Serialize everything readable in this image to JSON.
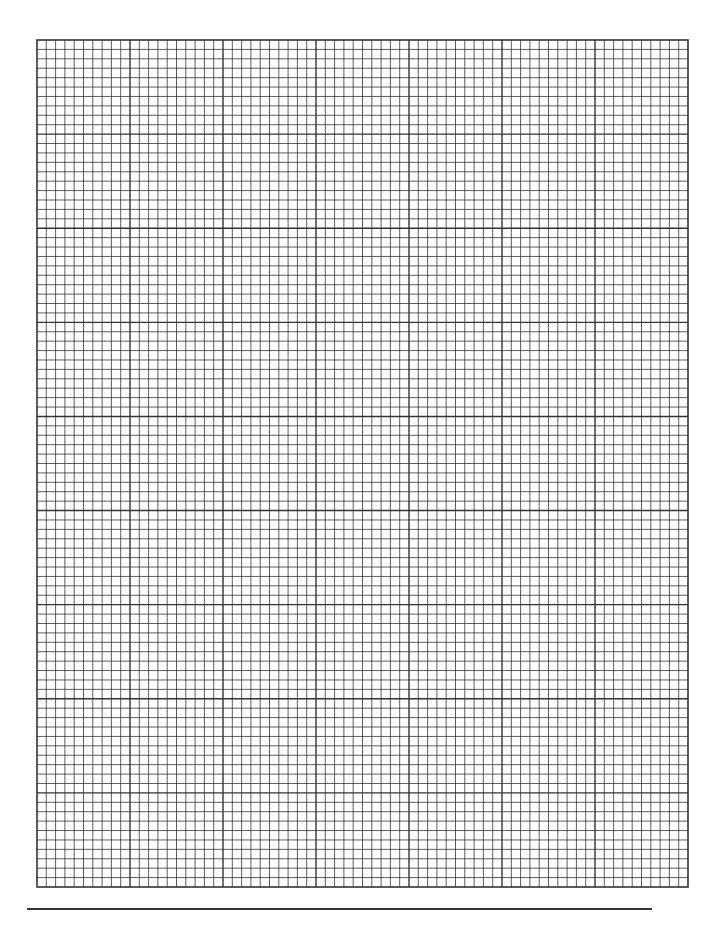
{
  "page": {
    "type": "graph-paper",
    "background": "#ffffff",
    "line_color": "#333333"
  },
  "grid": {
    "left": 37,
    "top": 40,
    "width": 651,
    "height": 847,
    "major_columns": 7,
    "major_rows": 9,
    "minor_per_major": 10,
    "major_stroke": 1.4,
    "minor_stroke": 0.8,
    "border_stroke": 1.6
  },
  "footer_rule": {
    "left": 27,
    "top": 908,
    "width": 625
  }
}
